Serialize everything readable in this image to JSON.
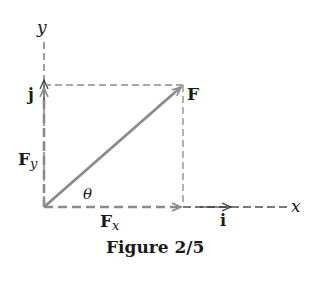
{
  "figure": {
    "caption": "Figure 2/5",
    "axes": {
      "x_label": "x",
      "y_label": "y"
    },
    "unit_vectors": {
      "i_label": "i",
      "j_label": "j"
    },
    "vector": {
      "label": "F",
      "component_x_label": "F",
      "component_x_sub": "x",
      "component_y_label": "F",
      "component_y_sub": "y",
      "angle_label": "θ"
    },
    "colors": {
      "vector": "#8a8a8a",
      "dashed": "#7a7a7a",
      "text": "#1a1a1a"
    }
  }
}
